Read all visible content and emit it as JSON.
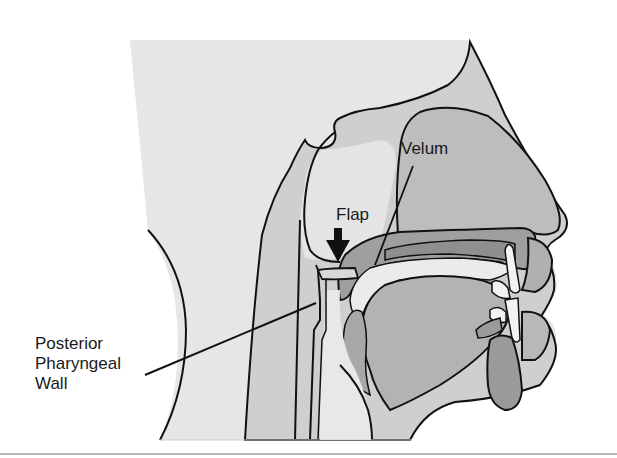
{
  "figure": {
    "labels": {
      "velum": "Velum",
      "flap": "Flap",
      "posterior_pharyngeal_wall": [
        "Posterior",
        "Pharyngeal",
        "Wall"
      ]
    },
    "annotations": {
      "flap_arrow": "arrow-down",
      "velum_leader": "line",
      "ppw_leader": "line"
    },
    "colors": {
      "background": "#ffffff",
      "skin_light": "#e6e6e6",
      "tissue_mid": "#cfcfcf",
      "tissue_dark": "#a9a9a9",
      "tissue_darker": "#8f8f8f",
      "airway_light": "#ededed",
      "outline": "#111111"
    }
  }
}
